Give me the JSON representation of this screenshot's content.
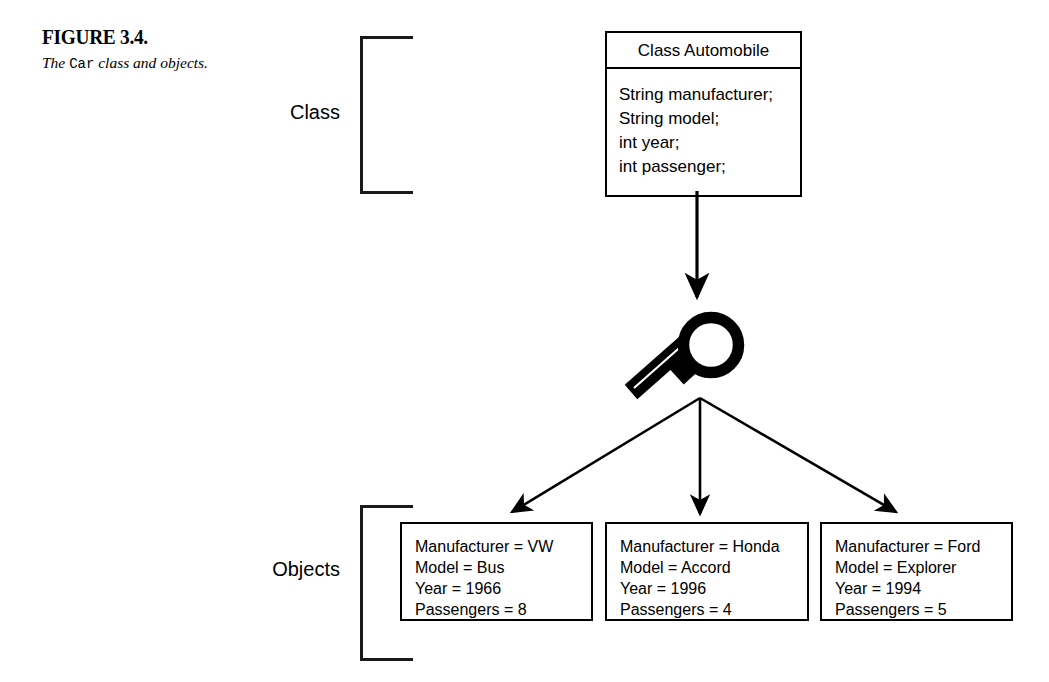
{
  "figure": {
    "number": "FIGURE 3.4.",
    "caption_prefix": "The ",
    "caption_code": "Car",
    "caption_suffix": " class and objects."
  },
  "labels": {
    "class": "Class",
    "objects": "Objects"
  },
  "class_box": {
    "header": "Class Automobile",
    "fields": [
      "String manufacturer;",
      "String model;",
      "int year;",
      "int passenger;"
    ]
  },
  "object_boxes": [
    {
      "lines": [
        "Manufacturer = VW",
        "Model = Bus",
        "Year = 1966",
        "Passengers = 8"
      ]
    },
    {
      "lines": [
        "Manufacturer = Honda",
        "Model = Accord",
        "Year = 1996",
        "Passengers = 4"
      ]
    },
    {
      "lines": [
        "Manufacturer = Ford",
        "Model = Explorer",
        "Year = 1994",
        "Passengers = 5"
      ]
    }
  ],
  "icons": {
    "magnifier": "magnifying-glass-icon"
  },
  "colors": {
    "ink": "#000000",
    "bracket": "#1a1a1a",
    "background": "#ffffff"
  }
}
